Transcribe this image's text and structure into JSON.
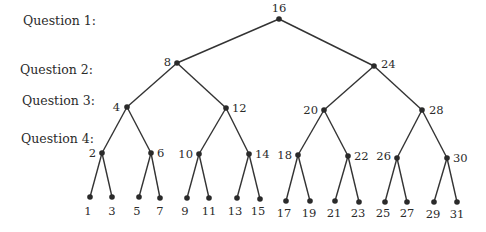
{
  "diagram": {
    "type": "binary-search-tree",
    "title": "",
    "colors": {
      "line": "#333333",
      "node": "#2a2a2a",
      "text": "#2b2b2b",
      "background": "#ffffff"
    },
    "question_labels": [
      {
        "text": "Question 1:",
        "x": 23,
        "y": 25
      },
      {
        "text": "Question 2:",
        "x": 20,
        "y": 74
      },
      {
        "text": "Question 3:",
        "x": 22,
        "y": 105
      },
      {
        "text": "Question 4:",
        "x": 21,
        "y": 143
      }
    ],
    "nodes": [
      {
        "id": "n16",
        "label": "16",
        "x": 279,
        "y": 19,
        "lx": 279,
        "ly": 12,
        "anchor": "middle"
      },
      {
        "id": "n8",
        "label": "8",
        "x": 177,
        "y": 63,
        "lx": 171,
        "ly": 66,
        "anchor": "end"
      },
      {
        "id": "n24",
        "label": "24",
        "x": 374,
        "y": 66,
        "lx": 381,
        "ly": 68,
        "anchor": "start"
      },
      {
        "id": "n4",
        "label": "4",
        "x": 127,
        "y": 107,
        "lx": 120,
        "ly": 111,
        "anchor": "end"
      },
      {
        "id": "n12",
        "label": "12",
        "x": 226,
        "y": 108,
        "lx": 232,
        "ly": 112,
        "anchor": "start"
      },
      {
        "id": "n20",
        "label": "20",
        "x": 324,
        "y": 110,
        "lx": 318,
        "ly": 114,
        "anchor": "end"
      },
      {
        "id": "n28",
        "label": "28",
        "x": 422,
        "y": 110,
        "lx": 429,
        "ly": 114,
        "anchor": "start"
      },
      {
        "id": "n2",
        "label": "2",
        "x": 102,
        "y": 153,
        "lx": 96,
        "ly": 157,
        "anchor": "end"
      },
      {
        "id": "n6",
        "label": "6",
        "x": 151,
        "y": 153,
        "lx": 157,
        "ly": 157,
        "anchor": "start"
      },
      {
        "id": "n10",
        "label": "10",
        "x": 199,
        "y": 154,
        "lx": 193,
        "ly": 158,
        "anchor": "end"
      },
      {
        "id": "n14",
        "label": "14",
        "x": 249,
        "y": 154,
        "lx": 255,
        "ly": 158,
        "anchor": "start"
      },
      {
        "id": "n18",
        "label": "18",
        "x": 298,
        "y": 155,
        "lx": 292,
        "ly": 159,
        "anchor": "end"
      },
      {
        "id": "n22",
        "label": "22",
        "x": 348,
        "y": 156,
        "lx": 354,
        "ly": 160,
        "anchor": "start"
      },
      {
        "id": "n26",
        "label": "26",
        "x": 397,
        "y": 158,
        "lx": 391,
        "ly": 160,
        "anchor": "end"
      },
      {
        "id": "n30",
        "label": "30",
        "x": 447,
        "y": 158,
        "lx": 453,
        "ly": 162,
        "anchor": "start"
      },
      {
        "id": "n1",
        "label": "1",
        "x": 90,
        "y": 197,
        "lx": 88,
        "ly": 215,
        "anchor": "middle"
      },
      {
        "id": "n3",
        "label": "3",
        "x": 112,
        "y": 197,
        "lx": 112,
        "ly": 215,
        "anchor": "middle"
      },
      {
        "id": "n5",
        "label": "5",
        "x": 139,
        "y": 197,
        "lx": 137,
        "ly": 215,
        "anchor": "middle"
      },
      {
        "id": "n7",
        "label": "7",
        "x": 160,
        "y": 198,
        "lx": 160,
        "ly": 215,
        "anchor": "middle"
      },
      {
        "id": "n9",
        "label": "9",
        "x": 187,
        "y": 198,
        "lx": 185,
        "ly": 215,
        "anchor": "middle"
      },
      {
        "id": "n11",
        "label": "11",
        "x": 209,
        "y": 198,
        "lx": 209,
        "ly": 215,
        "anchor": "middle"
      },
      {
        "id": "n13",
        "label": "13",
        "x": 237,
        "y": 198,
        "lx": 235,
        "ly": 215,
        "anchor": "middle"
      },
      {
        "id": "n15",
        "label": "15",
        "x": 260,
        "y": 199,
        "lx": 258,
        "ly": 215,
        "anchor": "middle"
      },
      {
        "id": "n17",
        "label": "17",
        "x": 286,
        "y": 201,
        "lx": 284,
        "ly": 217,
        "anchor": "middle"
      },
      {
        "id": "n19",
        "label": "19",
        "x": 310,
        "y": 201,
        "lx": 309,
        "ly": 217,
        "anchor": "middle"
      },
      {
        "id": "n21",
        "label": "21",
        "x": 335,
        "y": 201,
        "lx": 334,
        "ly": 217,
        "anchor": "middle"
      },
      {
        "id": "n23",
        "label": "23",
        "x": 359,
        "y": 202,
        "lx": 358,
        "ly": 217,
        "anchor": "middle"
      },
      {
        "id": "n25",
        "label": "25",
        "x": 385,
        "y": 202,
        "lx": 383,
        "ly": 217,
        "anchor": "middle"
      },
      {
        "id": "n27",
        "label": "27",
        "x": 407,
        "y": 202,
        "lx": 407,
        "ly": 217,
        "anchor": "middle"
      },
      {
        "id": "n29",
        "label": "29",
        "x": 434,
        "y": 202,
        "lx": 433,
        "ly": 218,
        "anchor": "middle"
      },
      {
        "id": "n31",
        "label": "31",
        "x": 457,
        "y": 202,
        "lx": 457,
        "ly": 218,
        "anchor": "middle"
      }
    ],
    "edges": [
      [
        "n16",
        "n8"
      ],
      [
        "n16",
        "n24"
      ],
      [
        "n8",
        "n4"
      ],
      [
        "n8",
        "n12"
      ],
      [
        "n24",
        "n20"
      ],
      [
        "n24",
        "n28"
      ],
      [
        "n4",
        "n2"
      ],
      [
        "n4",
        "n6"
      ],
      [
        "n12",
        "n10"
      ],
      [
        "n12",
        "n14"
      ],
      [
        "n20",
        "n18"
      ],
      [
        "n20",
        "n22"
      ],
      [
        "n28",
        "n26"
      ],
      [
        "n28",
        "n30"
      ],
      [
        "n2",
        "n1"
      ],
      [
        "n2",
        "n3"
      ],
      [
        "n6",
        "n5"
      ],
      [
        "n6",
        "n7"
      ],
      [
        "n10",
        "n9"
      ],
      [
        "n10",
        "n11"
      ],
      [
        "n14",
        "n13"
      ],
      [
        "n14",
        "n15"
      ],
      [
        "n18",
        "n17"
      ],
      [
        "n18",
        "n19"
      ],
      [
        "n22",
        "n21"
      ],
      [
        "n22",
        "n23"
      ],
      [
        "n26",
        "n25"
      ],
      [
        "n26",
        "n27"
      ],
      [
        "n30",
        "n29"
      ],
      [
        "n30",
        "n31"
      ]
    ]
  }
}
